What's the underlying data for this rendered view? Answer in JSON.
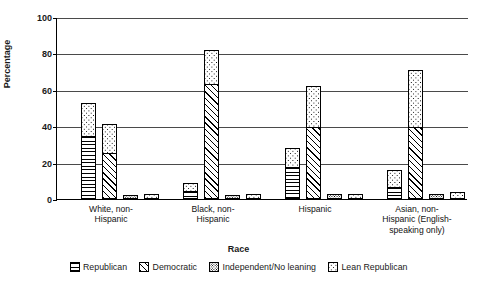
{
  "chart_data": {
    "type": "bar",
    "title": "",
    "xlabel": "Race",
    "ylabel": "Percentage",
    "ylim": [
      0,
      100
    ],
    "yticks": [
      0,
      20,
      40,
      60,
      80,
      100
    ],
    "grid": true,
    "legend_position": "bottom",
    "stacked_groups": true,
    "categories": [
      "White, non-Hispanic",
      "Black, non-Hispanic",
      "Hispanic",
      "Asian, non-Hispanic (English-speaking only)"
    ],
    "category_lines": [
      [
        "White, non-",
        "Hispanic"
      ],
      [
        "Black, non-",
        "Hispanic"
      ],
      [
        "Hispanic"
      ],
      [
        "Asian, non-",
        "Hispanic (English-",
        "speaking only)"
      ]
    ],
    "series": [
      {
        "name": "Republican",
        "pattern": "horizontal-lines",
        "values": [
          35,
          5,
          18,
          7
        ]
      },
      {
        "name": "Democratic",
        "pattern": "diagonal-lines",
        "values": [
          26,
          64,
          40,
          40
        ]
      },
      {
        "name": "Independent/No leaning",
        "pattern": "dense-dots",
        "values": [
          2,
          2,
          3,
          3
        ]
      },
      {
        "name": "Lean Republican",
        "pattern": "sparse-dots",
        "values": [
          3,
          3,
          3,
          4
        ]
      }
    ],
    "stack_tops": {
      "republican_with_lean": [
        53,
        9,
        28,
        16
      ],
      "democratic_with_lean": [
        41,
        82,
        62,
        71
      ]
    }
  },
  "legend": {
    "items": [
      {
        "label": "Republican",
        "pattern": "p-rep"
      },
      {
        "label": "Democratic",
        "pattern": "p-dem"
      },
      {
        "label": "Independent/No leaning",
        "pattern": "p-ind"
      },
      {
        "label": "Lean Republican",
        "pattern": "p-lean"
      }
    ]
  }
}
